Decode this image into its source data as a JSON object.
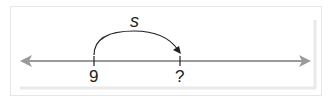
{
  "diagram": {
    "type": "number-line",
    "colors": {
      "axis": "#9a9a9a",
      "arc": "#222222",
      "frame": "#e6e6e6",
      "shadow": "#e9e9e9"
    },
    "arc_label": "s",
    "ticks": [
      {
        "label": "9"
      },
      {
        "label": "?"
      }
    ]
  }
}
